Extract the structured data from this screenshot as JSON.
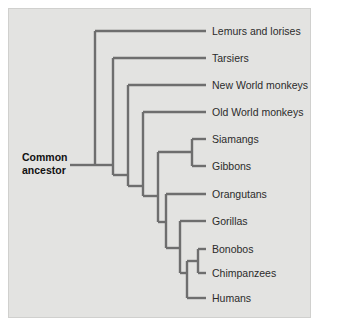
{
  "figure": {
    "type": "cladogram",
    "root_label_line1": "Common",
    "root_label_line2": "ancestor",
    "credit": "© Cengage Learning",
    "background_color": "#e3e3e1",
    "branch_color": "#6e6e6e",
    "label_color": "#2b2b2b"
  },
  "chart_data": {
    "type": "tree",
    "root": "Common ancestor",
    "tips": [
      {
        "label": "Lemurs and lorises",
        "y": 31,
        "tip_x": 206
      },
      {
        "label": "Tarsiers",
        "y": 58,
        "tip_x": 206
      },
      {
        "label": "New World monkeys",
        "y": 85,
        "tip_x": 206
      },
      {
        "label": "Old World monkeys",
        "y": 112,
        "tip_x": 206
      },
      {
        "label": "Siamangs",
        "y": 139,
        "tip_x": 206
      },
      {
        "label": "Gibbons",
        "y": 166,
        "tip_x": 206
      },
      {
        "label": "Orangutans",
        "y": 194,
        "tip_x": 206
      },
      {
        "label": "Gorillas",
        "y": 221,
        "tip_x": 206
      },
      {
        "label": "Bonobos",
        "y": 249,
        "tip_x": 206
      },
      {
        "label": "Chimpanzees",
        "y": 273,
        "tip_x": 206
      },
      {
        "label": "Humans",
        "y": 298,
        "tip_x": 206
      }
    ],
    "nodes": [
      {
        "name": "root",
        "x": 95,
        "y": 165,
        "children_y": [
          31,
          300
        ]
      },
      {
        "name": "haplorhini",
        "x": 113,
        "y": 165,
        "children_y": [
          58,
          300
        ]
      },
      {
        "name": "simiiformes",
        "x": 128,
        "y": 175,
        "children_y": [
          85,
          300
        ]
      },
      {
        "name": "catarrhini",
        "x": 143,
        "y": 186,
        "children_y": [
          112,
          300
        ]
      },
      {
        "name": "hominoidea",
        "x": 158,
        "y": 196,
        "children_y": [
          152,
          300
        ]
      },
      {
        "name": "hylobatidae",
        "x": 192,
        "y": 152,
        "children_y": [
          139,
          166
        ]
      },
      {
        "name": "hominidae",
        "x": 166,
        "y": 222,
        "children_y": [
          194,
          298
        ]
      },
      {
        "name": "homininae",
        "x": 180,
        "y": 248,
        "children_y": [
          221,
          298
        ]
      },
      {
        "name": "hominini",
        "x": 187,
        "y": 273,
        "children_y": [
          262,
          298
        ]
      },
      {
        "name": "pan",
        "x": 198,
        "y": 261,
        "children_y": [
          249,
          273
        ]
      }
    ]
  }
}
